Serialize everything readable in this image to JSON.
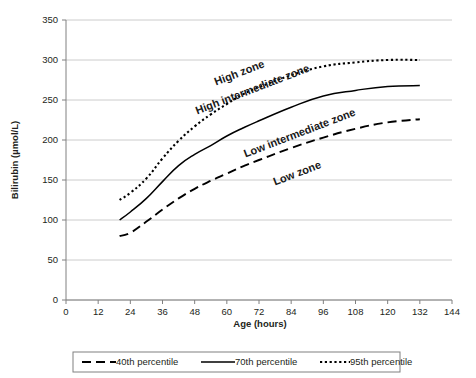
{
  "chart_data": {
    "type": "line",
    "title": "",
    "xlabel": "Age (hours)",
    "ylabel": "Bilirubin (µmol/L)",
    "xlim": [
      0,
      144
    ],
    "ylim": [
      0,
      350
    ],
    "xticks": [
      0,
      12,
      24,
      36,
      48,
      60,
      72,
      84,
      96,
      108,
      120,
      132,
      144
    ],
    "yticks": [
      0,
      50,
      100,
      150,
      200,
      250,
      300,
      350
    ],
    "grid": "horizontal",
    "legend_position": "bottom",
    "series": [
      {
        "name": "40th percentile",
        "style": "dashed",
        "x": [
          20,
          24,
          30,
          36,
          42,
          48,
          54,
          60,
          66,
          72,
          84,
          96,
          108,
          120,
          132
        ],
        "values": [
          80,
          84,
          98,
          113,
          127,
          139,
          149,
          158,
          167,
          175,
          190,
          203,
          214,
          222,
          226
        ]
      },
      {
        "name": "70th percentile",
        "style": "solid",
        "x": [
          20,
          24,
          30,
          36,
          42,
          48,
          54,
          60,
          66,
          72,
          84,
          96,
          108,
          120,
          132
        ],
        "values": [
          100,
          110,
          127,
          148,
          168,
          182,
          193,
          205,
          215,
          224,
          241,
          255,
          262,
          267,
          268
        ]
      },
      {
        "name": "95th percentile",
        "style": "dotted",
        "x": [
          20,
          24,
          30,
          36,
          42,
          48,
          54,
          60,
          66,
          72,
          84,
          96,
          108,
          120,
          132
        ],
        "values": [
          125,
          134,
          152,
          177,
          199,
          217,
          232,
          245,
          257,
          266,
          281,
          292,
          297,
          300,
          300
        ]
      }
    ],
    "annotations": [
      {
        "text": "High zone",
        "x": 56,
        "y": 268,
        "rotation": -21
      },
      {
        "text": "High intermediate zone",
        "x": 49,
        "y": 232,
        "rotation": -21
      },
      {
        "text": "Low intermediate zone",
        "x": 67,
        "y": 178,
        "rotation": -21
      },
      {
        "text": "Low zone",
        "x": 78,
        "y": 143,
        "rotation": -21
      }
    ]
  },
  "axes": {
    "x": {
      "title": "Age (hours)",
      "tick_labels": [
        "0",
        "12",
        "24",
        "36",
        "48",
        "60",
        "72",
        "84",
        "96",
        "108",
        "120",
        "132",
        "144"
      ]
    },
    "y": {
      "title": "Bilirubin (µmol/L)",
      "tick_labels": [
        "0",
        "50",
        "100",
        "150",
        "200",
        "250",
        "300",
        "350"
      ]
    }
  },
  "legend": {
    "items": [
      {
        "label": "40th percentile",
        "style": "dashed"
      },
      {
        "label": "70th percentile",
        "style": "solid"
      },
      {
        "label": "95th percentile",
        "style": "dotted"
      }
    ]
  },
  "zones": [
    {
      "label": "High zone"
    },
    {
      "label": "High intermediate zone"
    },
    {
      "label": "Low intermediate zone"
    },
    {
      "label": "Low zone"
    }
  ]
}
